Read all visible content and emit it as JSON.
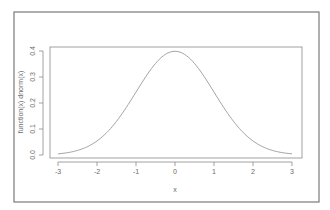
{
  "chart_data": {
    "type": "line",
    "title": "",
    "xlabel": "x",
    "ylabel": "function(x) dnorm(x)",
    "xlim": [
      -3,
      3
    ],
    "ylim": [
      0,
      0.4
    ],
    "grid": false,
    "legend": null,
    "x_ticks": [
      "-3",
      "-2",
      "-1",
      "0",
      "1",
      "2",
      "3"
    ],
    "y_ticks": [
      "0.0",
      "0.1",
      "0.2",
      "0.3",
      "0.4"
    ],
    "series": [
      {
        "name": "dnorm(x)",
        "x": [
          -3,
          -2.5,
          -2,
          -1.5,
          -1,
          -0.5,
          0,
          0.5,
          1,
          1.5,
          2,
          2.5,
          3
        ],
        "values": [
          0.0044,
          0.0175,
          0.054,
          0.1295,
          0.242,
          0.3521,
          0.3989,
          0.3521,
          0.242,
          0.1295,
          0.054,
          0.0175,
          0.0044
        ]
      }
    ]
  },
  "colors": {
    "frame": "#7a7a7a",
    "axis": "#8a8a8a",
    "curve": "#9a9a9a",
    "text": "#6a6a6a"
  }
}
